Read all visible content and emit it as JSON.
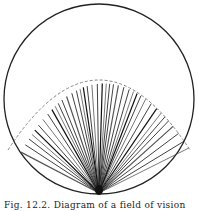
{
  "figure": {
    "circle": {
      "cx": 99,
      "cy": 99,
      "r": 95,
      "stroke": "#222222"
    },
    "origin": {
      "x": 99,
      "y": 193
    },
    "dashed_arc": {
      "peak_y": 77,
      "left_end": [
        8,
        150
      ],
      "right_end": [
        190,
        150
      ],
      "stroke": "#777777"
    },
    "line_color": "#111111",
    "ray_count": 40
  },
  "caption": {
    "text": "Fig. 12.2.  Diagram of a field of vision"
  }
}
